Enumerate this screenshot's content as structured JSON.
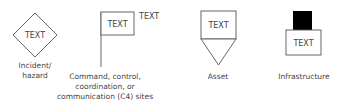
{
  "symbols": [
    {
      "id": "incident",
      "shape": "diamond",
      "inner_text": "TEXT",
      "caption_lines": [
        "Incident/",
        "hazard"
      ]
    },
    {
      "id": "c4-sites",
      "shape": "flag",
      "inner_text": "TEXT",
      "side_text": "TEXT",
      "caption_lines": [
        "Command, control,",
        "coordination, or",
        "communication (C4) sites"
      ]
    },
    {
      "id": "asset",
      "shape": "box-with-downward-triangle",
      "inner_text": "TEXT",
      "caption_lines": [
        "Asset"
      ]
    },
    {
      "id": "infrastructure",
      "shape": "box-with-black-square-top",
      "inner_text": "TEXT",
      "caption_lines": [
        "Infrastructure"
      ]
    }
  ],
  "colors": {
    "stroke": "#555555",
    "fill_dark": "#000000",
    "text": "#444444"
  }
}
